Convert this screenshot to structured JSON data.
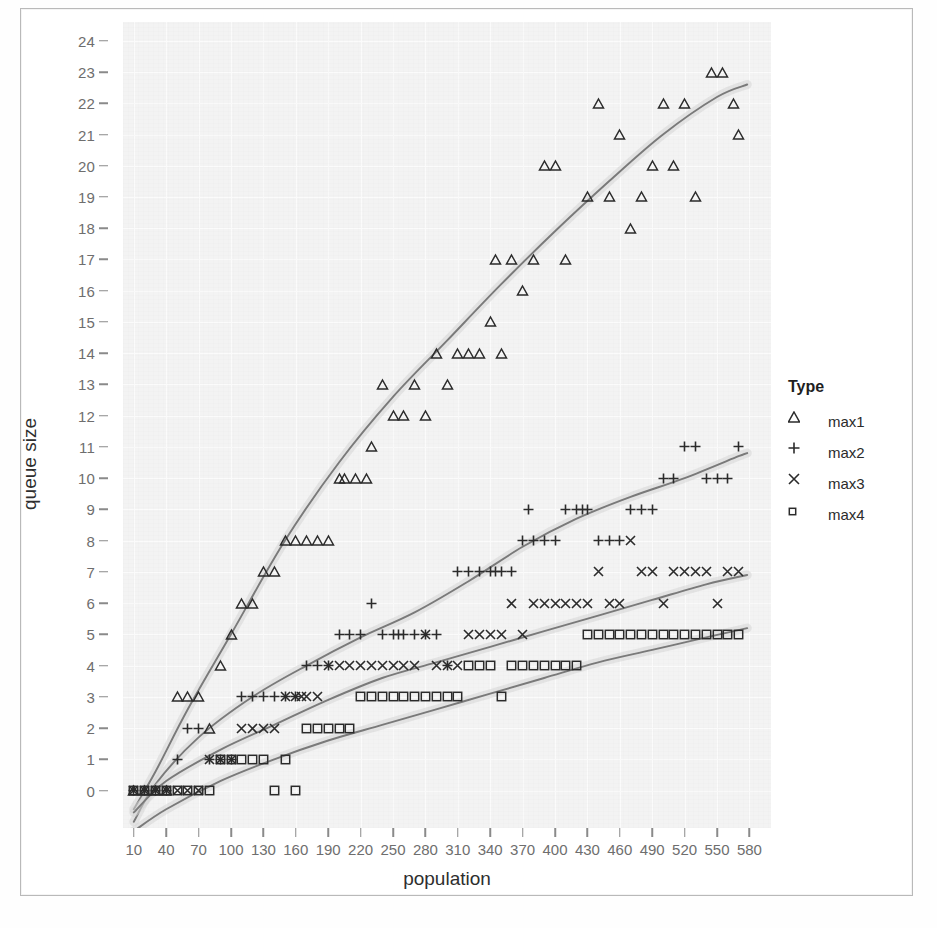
{
  "chart_data": {
    "type": "scatter",
    "title": "",
    "xlabel": "population",
    "ylabel": "queue size",
    "legend_title": "Type",
    "legend_position": "right",
    "grid": true,
    "xlim": [
      0,
      600
    ],
    "ylim": [
      -1.2,
      24.6
    ],
    "xticks": [
      10,
      40,
      70,
      100,
      130,
      160,
      190,
      220,
      250,
      280,
      310,
      340,
      370,
      400,
      430,
      460,
      490,
      520,
      550,
      580
    ],
    "yticks": [
      0,
      1,
      2,
      3,
      4,
      5,
      6,
      7,
      8,
      9,
      10,
      11,
      12,
      13,
      14,
      15,
      16,
      17,
      18,
      19,
      20,
      21,
      22,
      23,
      24
    ],
    "series": [
      {
        "name": "max1",
        "marker": "triangle",
        "color": "#2b2b2b",
        "smooth_line": true,
        "points": [
          [
            10,
            0
          ],
          [
            20,
            0
          ],
          [
            30,
            0
          ],
          [
            40,
            0
          ],
          [
            50,
            3
          ],
          [
            60,
            3
          ],
          [
            70,
            3
          ],
          [
            80,
            2
          ],
          [
            90,
            4
          ],
          [
            100,
            5
          ],
          [
            110,
            6
          ],
          [
            120,
            6
          ],
          [
            130,
            7
          ],
          [
            140,
            7
          ],
          [
            150,
            8
          ],
          [
            160,
            8
          ],
          [
            170,
            8
          ],
          [
            180,
            8
          ],
          [
            190,
            8
          ],
          [
            200,
            10
          ],
          [
            205,
            10
          ],
          [
            215,
            10
          ],
          [
            225,
            10
          ],
          [
            230,
            11
          ],
          [
            240,
            13
          ],
          [
            250,
            12
          ],
          [
            260,
            12
          ],
          [
            270,
            13
          ],
          [
            280,
            12
          ],
          [
            290,
            14
          ],
          [
            300,
            13
          ],
          [
            310,
            14
          ],
          [
            320,
            14
          ],
          [
            330,
            14
          ],
          [
            340,
            15
          ],
          [
            345,
            17
          ],
          [
            350,
            14
          ],
          [
            360,
            17
          ],
          [
            370,
            16
          ],
          [
            380,
            17
          ],
          [
            390,
            20
          ],
          [
            400,
            20
          ],
          [
            410,
            17
          ],
          [
            430,
            19
          ],
          [
            440,
            22
          ],
          [
            450,
            19
          ],
          [
            460,
            21
          ],
          [
            470,
            18
          ],
          [
            480,
            19
          ],
          [
            490,
            20
          ],
          [
            500,
            22
          ],
          [
            510,
            20
          ],
          [
            520,
            22
          ],
          [
            530,
            19
          ],
          [
            545,
            23
          ],
          [
            555,
            23
          ],
          [
            565,
            22
          ],
          [
            570,
            21
          ]
        ]
      },
      {
        "name": "max2",
        "marker": "plus",
        "color": "#2b2b2b",
        "smooth_line": true,
        "points": [
          [
            10,
            0
          ],
          [
            20,
            0
          ],
          [
            30,
            0
          ],
          [
            40,
            0
          ],
          [
            50,
            1
          ],
          [
            60,
            2
          ],
          [
            70,
            2
          ],
          [
            80,
            1
          ],
          [
            90,
            1
          ],
          [
            100,
            1
          ],
          [
            110,
            3
          ],
          [
            120,
            3
          ],
          [
            130,
            3
          ],
          [
            140,
            3
          ],
          [
            150,
            3
          ],
          [
            160,
            3
          ],
          [
            170,
            4
          ],
          [
            180,
            4
          ],
          [
            190,
            4
          ],
          [
            200,
            5
          ],
          [
            210,
            5
          ],
          [
            220,
            5
          ],
          [
            230,
            6
          ],
          [
            240,
            5
          ],
          [
            250,
            5
          ],
          [
            255,
            5
          ],
          [
            260,
            5
          ],
          [
            270,
            5
          ],
          [
            280,
            5
          ],
          [
            290,
            5
          ],
          [
            300,
            4
          ],
          [
            310,
            7
          ],
          [
            320,
            7
          ],
          [
            330,
            7
          ],
          [
            340,
            7
          ],
          [
            345,
            7
          ],
          [
            350,
            7
          ],
          [
            360,
            7
          ],
          [
            370,
            8
          ],
          [
            375,
            9
          ],
          [
            380,
            8
          ],
          [
            390,
            8
          ],
          [
            400,
            8
          ],
          [
            410,
            9
          ],
          [
            420,
            9
          ],
          [
            425,
            9
          ],
          [
            430,
            9
          ],
          [
            440,
            8
          ],
          [
            450,
            8
          ],
          [
            460,
            8
          ],
          [
            470,
            9
          ],
          [
            480,
            9
          ],
          [
            490,
            9
          ],
          [
            500,
            10
          ],
          [
            510,
            10
          ],
          [
            520,
            11
          ],
          [
            530,
            11
          ],
          [
            540,
            10
          ],
          [
            550,
            10
          ],
          [
            560,
            10
          ],
          [
            570,
            11
          ]
        ]
      },
      {
        "name": "max3",
        "marker": "cross",
        "color": "#2b2b2b",
        "smooth_line": true,
        "points": [
          [
            10,
            0
          ],
          [
            20,
            0
          ],
          [
            30,
            0
          ],
          [
            40,
            0
          ],
          [
            50,
            0
          ],
          [
            60,
            0
          ],
          [
            70,
            0
          ],
          [
            80,
            1
          ],
          [
            90,
            1
          ],
          [
            100,
            1
          ],
          [
            110,
            2
          ],
          [
            120,
            2
          ],
          [
            130,
            2
          ],
          [
            140,
            2
          ],
          [
            150,
            3
          ],
          [
            160,
            3
          ],
          [
            165,
            3
          ],
          [
            170,
            3
          ],
          [
            180,
            3
          ],
          [
            190,
            4
          ],
          [
            200,
            4
          ],
          [
            210,
            4
          ],
          [
            220,
            4
          ],
          [
            230,
            4
          ],
          [
            240,
            4
          ],
          [
            250,
            4
          ],
          [
            260,
            4
          ],
          [
            270,
            4
          ],
          [
            280,
            5
          ],
          [
            290,
            4
          ],
          [
            300,
            4
          ],
          [
            310,
            4
          ],
          [
            320,
            5
          ],
          [
            330,
            5
          ],
          [
            340,
            5
          ],
          [
            350,
            5
          ],
          [
            360,
            6
          ],
          [
            370,
            5
          ],
          [
            380,
            6
          ],
          [
            390,
            6
          ],
          [
            400,
            6
          ],
          [
            410,
            6
          ],
          [
            420,
            6
          ],
          [
            430,
            6
          ],
          [
            440,
            7
          ],
          [
            450,
            6
          ],
          [
            460,
            6
          ],
          [
            470,
            8
          ],
          [
            480,
            7
          ],
          [
            490,
            7
          ],
          [
            500,
            6
          ],
          [
            510,
            7
          ],
          [
            520,
            7
          ],
          [
            530,
            7
          ],
          [
            540,
            7
          ],
          [
            550,
            6
          ],
          [
            560,
            7
          ],
          [
            570,
            7
          ]
        ]
      },
      {
        "name": "max4",
        "marker": "square",
        "color": "#2b2b2b",
        "smooth_line": true,
        "points": [
          [
            10,
            0
          ],
          [
            20,
            0
          ],
          [
            30,
            0
          ],
          [
            40,
            0
          ],
          [
            50,
            0
          ],
          [
            60,
            0
          ],
          [
            70,
            0
          ],
          [
            80,
            0
          ],
          [
            90,
            1
          ],
          [
            100,
            1
          ],
          [
            110,
            1
          ],
          [
            120,
            1
          ],
          [
            130,
            1
          ],
          [
            140,
            0
          ],
          [
            150,
            1
          ],
          [
            160,
            0
          ],
          [
            170,
            2
          ],
          [
            180,
            2
          ],
          [
            190,
            2
          ],
          [
            200,
            2
          ],
          [
            210,
            2
          ],
          [
            220,
            3
          ],
          [
            230,
            3
          ],
          [
            240,
            3
          ],
          [
            250,
            3
          ],
          [
            260,
            3
          ],
          [
            270,
            3
          ],
          [
            280,
            3
          ],
          [
            290,
            3
          ],
          [
            300,
            3
          ],
          [
            310,
            3
          ],
          [
            320,
            4
          ],
          [
            330,
            4
          ],
          [
            340,
            4
          ],
          [
            350,
            3
          ],
          [
            360,
            4
          ],
          [
            370,
            4
          ],
          [
            380,
            4
          ],
          [
            390,
            4
          ],
          [
            400,
            4
          ],
          [
            410,
            4
          ],
          [
            420,
            4
          ],
          [
            430,
            5
          ],
          [
            440,
            5
          ],
          [
            450,
            5
          ],
          [
            460,
            5
          ],
          [
            470,
            5
          ],
          [
            480,
            5
          ],
          [
            490,
            5
          ],
          [
            500,
            5
          ],
          [
            510,
            5
          ],
          [
            520,
            5
          ],
          [
            530,
            5
          ],
          [
            540,
            5
          ],
          [
            550,
            5
          ],
          [
            560,
            5
          ],
          [
            570,
            5
          ]
        ]
      }
    ],
    "trend_lines": [
      {
        "name": "max1-trend",
        "color": "#7a7a7a",
        "band_color": "#d6d6d6",
        "path": [
          [
            10,
            -0.6
          ],
          [
            30,
            0.6
          ],
          [
            60,
            2.6
          ],
          [
            100,
            5.0
          ],
          [
            150,
            8.0
          ],
          [
            200,
            10.5
          ],
          [
            250,
            12.6
          ],
          [
            300,
            14.4
          ],
          [
            350,
            16.2
          ],
          [
            400,
            17.9
          ],
          [
            450,
            19.5
          ],
          [
            500,
            21.0
          ],
          [
            550,
            22.2
          ],
          [
            578,
            22.6
          ]
        ]
      },
      {
        "name": "max2-trend",
        "color": "#7a7a7a",
        "band_color": "#d6d6d6",
        "path": [
          [
            10,
            -1.0
          ],
          [
            30,
            0.2
          ],
          [
            70,
            1.7
          ],
          [
            120,
            3.0
          ],
          [
            170,
            4.0
          ],
          [
            220,
            4.9
          ],
          [
            270,
            5.7
          ],
          [
            320,
            6.7
          ],
          [
            370,
            7.8
          ],
          [
            420,
            8.7
          ],
          [
            470,
            9.4
          ],
          [
            520,
            10.0
          ],
          [
            570,
            10.7
          ],
          [
            578,
            10.8
          ]
        ]
      },
      {
        "name": "max3-trend",
        "color": "#7a7a7a",
        "band_color": "#d6d6d6",
        "path": [
          [
            10,
            -0.7
          ],
          [
            40,
            0.3
          ],
          [
            90,
            1.3
          ],
          [
            140,
            2.1
          ],
          [
            190,
            2.9
          ],
          [
            240,
            3.6
          ],
          [
            290,
            4.1
          ],
          [
            340,
            4.6
          ],
          [
            390,
            5.1
          ],
          [
            440,
            5.6
          ],
          [
            490,
            6.1
          ],
          [
            540,
            6.6
          ],
          [
            578,
            6.9
          ]
        ]
      },
      {
        "name": "max4-trend",
        "color": "#7a7a7a",
        "band_color": "#d6d6d6",
        "path": [
          [
            10,
            -1.3
          ],
          [
            40,
            -0.6
          ],
          [
            90,
            0.3
          ],
          [
            140,
            1.0
          ],
          [
            190,
            1.6
          ],
          [
            240,
            2.1
          ],
          [
            290,
            2.6
          ],
          [
            340,
            3.1
          ],
          [
            390,
            3.6
          ],
          [
            440,
            4.1
          ],
          [
            490,
            4.5
          ],
          [
            540,
            4.9
          ],
          [
            578,
            5.2
          ]
        ]
      }
    ]
  },
  "legend": {
    "title": "Type",
    "items": [
      {
        "label": "max1",
        "marker": "triangle"
      },
      {
        "label": "max2",
        "marker": "plus"
      },
      {
        "label": "max3",
        "marker": "cross"
      },
      {
        "label": "max4",
        "marker": "square"
      }
    ]
  },
  "axes": {
    "x_title": "population",
    "y_title": "queue size"
  },
  "colors": {
    "panel_background": "#f3f3f3",
    "gridline": "#fbfbfb",
    "marker": "#2b2b2b",
    "trend_line": "#7a7a7a",
    "trend_band": "#d6d6d6",
    "axis_text": "#6e6e6e",
    "title_text": "#2e2e2e"
  }
}
